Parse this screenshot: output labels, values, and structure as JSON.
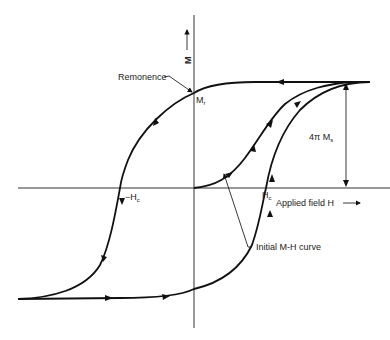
{
  "diagram": {
    "axes": {
      "y_label": "M",
      "x_label": "Applied field H"
    },
    "labels": {
      "remanence": "Remonence",
      "mr": "M",
      "mr_sub": "r",
      "neg_hc": "−H",
      "neg_hc_sub": "c",
      "hc": "H",
      "hc_sub": "c",
      "saturation": "4π M",
      "saturation_sub": "s",
      "initial_curve": "Initial M-H curve"
    },
    "colors": {
      "line": "#111111",
      "background": "#ffffff"
    }
  }
}
